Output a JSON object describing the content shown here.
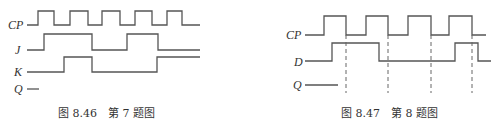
{
  "figures": [
    {
      "id": "fig-8-46",
      "caption": "图 8.46　第 7 题图",
      "signals": [
        {
          "name": "CP",
          "label": "CP"
        },
        {
          "name": "J",
          "label": "J"
        },
        {
          "name": "K",
          "label": "K"
        },
        {
          "name": "Q",
          "label": "Q"
        }
      ]
    },
    {
      "id": "fig-8-47",
      "caption": "图 8.47　第 8 题图",
      "signals": [
        {
          "name": "CP",
          "label": "CP"
        },
        {
          "name": "D",
          "label": "D"
        },
        {
          "name": "Q",
          "label": "Q"
        }
      ]
    }
  ],
  "colors": {
    "line": "#555555",
    "text": "#333333",
    "background": "#ffffff"
  }
}
